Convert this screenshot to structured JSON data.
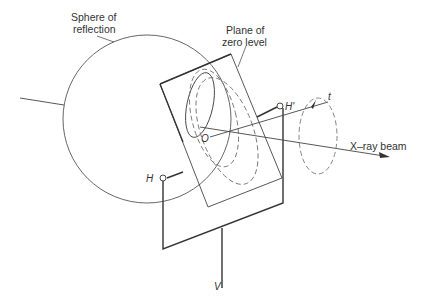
{
  "diagram": {
    "labels": {
      "sphere": [
        "Sphere of",
        "reflection"
      ],
      "plane": [
        "Plane of",
        "zero level"
      ],
      "origin": "O",
      "h_prime": "H'",
      "h": "H",
      "t": "t",
      "v": "V",
      "beam": "X–ray beam"
    },
    "colors": {
      "line": "#333333",
      "thin_line": "#555555",
      "dashed": "#777777",
      "background": "#ffffff"
    }
  }
}
